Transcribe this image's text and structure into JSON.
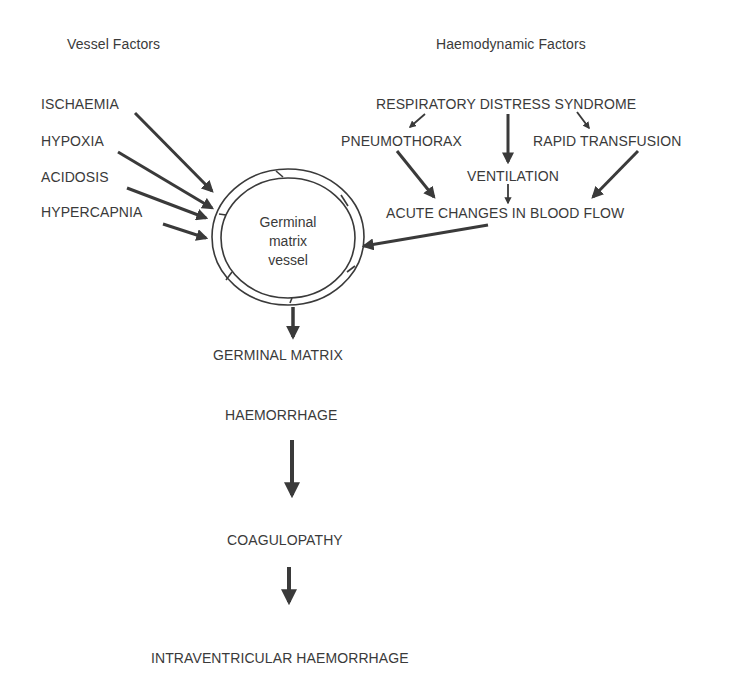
{
  "headers": {
    "vessel": "Vessel Factors",
    "haemodynamic": "Haemodynamic Factors"
  },
  "vessel_factors": [
    "ISCHAEMIA",
    "HYPOXIA",
    "ACIDOSIS",
    "HYPERCAPNIA"
  ],
  "haemodynamic": {
    "rds": "RESPIRATORY DISTRESS SYNDROME",
    "pneumothorax": "PNEUMOTHORAX",
    "rapid_transfusion": "RAPID TRANSFUSION",
    "ventilation": "VENTILATION",
    "acute_changes": "ACUTE CHANGES IN BLOOD FLOW"
  },
  "vessel": {
    "line1": "Germinal",
    "line2": "matrix",
    "line3": "vessel"
  },
  "cascade": {
    "gm": "GERMINAL MATRIX",
    "haemorrhage": "HAEMORRHAGE",
    "coagulopathy": "COAGULOPATHY",
    "ivh": "INTRAVENTRICULAR HAEMORRHAGE"
  },
  "colors": {
    "text": "#3a3a3a",
    "arrow": "#3a3a3a",
    "background": "#ffffff"
  }
}
